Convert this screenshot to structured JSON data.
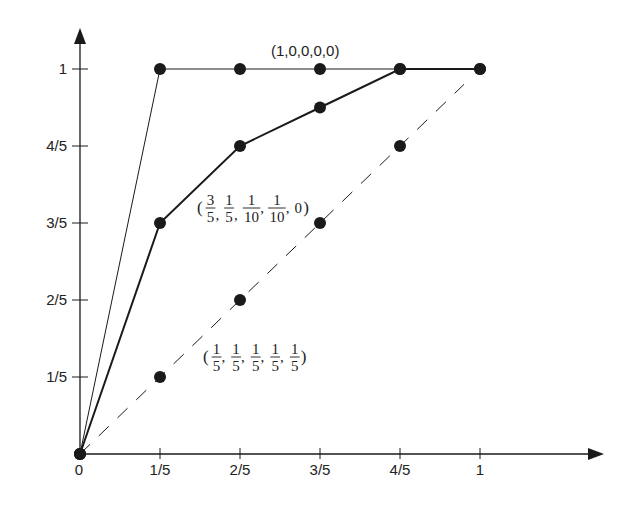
{
  "chart_data": {
    "type": "line",
    "title": "",
    "xlabel": "",
    "ylabel": "",
    "xlim": [
      0,
      1
    ],
    "ylim": [
      0,
      1
    ],
    "grid": false,
    "legend": "none",
    "x": [
      0,
      0.2,
      0.4,
      0.6,
      0.8,
      1.0
    ],
    "x_tick_labels": [
      "0",
      "1/5",
      "2/5",
      "3/5",
      "4/5",
      "1"
    ],
    "y_tick_labels": [
      "1/5",
      "2/5",
      "3/5",
      "4/5",
      "1"
    ],
    "y_ticks": [
      0.2,
      0.4,
      0.6,
      0.8,
      1.0
    ],
    "series": [
      {
        "name": "(1,0,0,0,0)",
        "style": "solid-thin",
        "markers": true,
        "values": [
          0,
          1.0,
          1.0,
          1.0,
          1.0,
          1.0
        ]
      },
      {
        "name": "(3/5, 1/5, 1/10, 1/10, 0)",
        "style": "solid-thick",
        "markers": true,
        "values": [
          0,
          0.6,
          0.8,
          0.9,
          1.0,
          1.0
        ]
      },
      {
        "name": "(1/5, 1/5, 1/5, 1/5, 1/5)",
        "style": "dashed",
        "markers": true,
        "values": [
          0,
          0.2,
          0.4,
          0.6,
          0.8,
          1.0
        ]
      }
    ],
    "annotations": [
      {
        "text": "(1,0,0,0,0)",
        "near_series": 0
      },
      {
        "text": "(3/5, 1/5, 1/10, 1/10, 0)",
        "near_series": 1
      },
      {
        "text": "(1/5, 1/5, 1/5, 1/5, 1/5)",
        "near_series": 2
      }
    ]
  },
  "labels": {
    "annot_uniform": "(1,0,0,0,0)",
    "frac": {
      "open": "(",
      "close": ")",
      "comma": ",",
      "zero": "0",
      "n1": "1",
      "n3": "3",
      "d5": "5",
      "d10": "10"
    }
  },
  "colors": {
    "ink": "#1a1a1a",
    "background": "#ffffff"
  }
}
